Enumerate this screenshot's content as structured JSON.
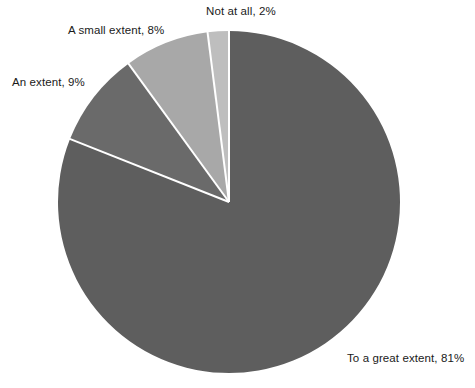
{
  "chart_data": {
    "type": "pie",
    "title": "",
    "subtitle": "",
    "xlabel": "",
    "ylabel": "",
    "grid": false,
    "legend": "none",
    "labels_position": "outside",
    "units": "percent",
    "total": 100,
    "start_angle_deg": 0,
    "direction": "clockwise",
    "categories": [
      "To a great extent",
      "An extent",
      "A small extent",
      "Not at all"
    ],
    "values": [
      81,
      9,
      8,
      2
    ],
    "slices": [
      {
        "category": "To a great extent",
        "value": 81,
        "value_text": "81%",
        "label": "To a great extent, 81%",
        "color": "#5e5e5e",
        "start_angle_deg": 0,
        "end_angle_deg": 291.6
      },
      {
        "category": "An extent",
        "value": 9,
        "value_text": "9%",
        "label": "An extent, 9%",
        "color": "#6a6a6a",
        "start_angle_deg": 291.6,
        "end_angle_deg": 324.0
      },
      {
        "category": "A small extent",
        "value": 8,
        "value_text": "8%",
        "label": "A small extent, 8%",
        "color": "#a8a8a8",
        "start_angle_deg": 324.0,
        "end_angle_deg": 352.8
      },
      {
        "category": "Not at all",
        "value": 2,
        "value_text": "2%",
        "label": "Not at all, 2%",
        "color": "#bebebe",
        "start_angle_deg": 352.8,
        "end_angle_deg": 360.0
      }
    ],
    "geometry": {
      "center_x": 229,
      "center_y": 202,
      "radius": 171
    },
    "style": {
      "background": "#ffffff",
      "separator_color": "#ffffff",
      "separator_width": 2,
      "label_color": "#1a1a1a"
    }
  }
}
